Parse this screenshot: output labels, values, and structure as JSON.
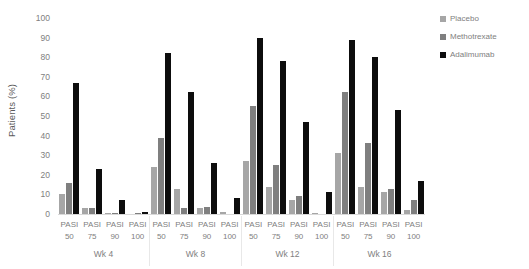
{
  "chart_data": {
    "type": "bar",
    "title": "",
    "subtitle": "",
    "xlabel": "",
    "ylabel": "Patients (%)",
    "ylim": [
      0,
      100
    ],
    "yticks": [
      0,
      10,
      20,
      30,
      40,
      50,
      60,
      70,
      80,
      90,
      100
    ],
    "grid": false,
    "legend_position": "right",
    "groups": [
      "Wk 4",
      "Wk 8",
      "Wk 12",
      "Wk 16"
    ],
    "categories": [
      "PASI 50",
      "PASI 75",
      "PASI 90",
      "PASI 100"
    ],
    "category_lines": [
      {
        "line1": "PASI",
        "line2": "50"
      },
      {
        "line1": "PASI",
        "line2": "75"
      },
      {
        "line1": "PASI",
        "line2": "90"
      },
      {
        "line1": "PASI",
        "line2": "100"
      }
    ],
    "series": [
      {
        "name": "Placebo",
        "color": "#a6a6a6",
        "values_by_group": {
          "Wk 4": [
            10,
            3,
            0.5,
            0
          ],
          "Wk 8": [
            24,
            13,
            3,
            0.8
          ],
          "Wk 12": [
            27,
            14,
            7,
            0.6
          ],
          "Wk 16": [
            31,
            14,
            11,
            2
          ]
        }
      },
      {
        "name": "Methotrexate",
        "color": "#7f7f7f",
        "values_by_group": {
          "Wk 4": [
            16,
            3,
            0.6,
            0.5
          ],
          "Wk 8": [
            39,
            3,
            3.5,
            0
          ],
          "Wk 12": [
            55,
            25,
            9,
            0
          ],
          "Wk 16": [
            62,
            36,
            13,
            7
          ]
        }
      },
      {
        "name": "Adalimumab",
        "color": "#0d0d0d",
        "values_by_group": {
          "Wk 4": [
            67,
            23,
            7,
            1
          ],
          "Wk 8": [
            82,
            62,
            26,
            8
          ],
          "Wk 12": [
            90,
            78,
            47,
            11
          ],
          "Wk 16": [
            89,
            80,
            53,
            17
          ]
        }
      }
    ]
  },
  "legend": {
    "items": [
      {
        "label": "Placebo",
        "color": "#a6a6a6",
        "icon": "square-swatch-icon"
      },
      {
        "label": "Methotrexate",
        "color": "#7f7f7f",
        "icon": "square-swatch-icon"
      },
      {
        "label": "Adalimumab",
        "color": "#0d0d0d",
        "icon": "square-swatch-icon"
      }
    ]
  },
  "axes": {
    "y_title": "Patients (%)",
    "y_tick_labels": [
      "100",
      "90",
      "80",
      "70",
      "60",
      "50",
      "40",
      "30",
      "20",
      "10",
      "0"
    ]
  }
}
